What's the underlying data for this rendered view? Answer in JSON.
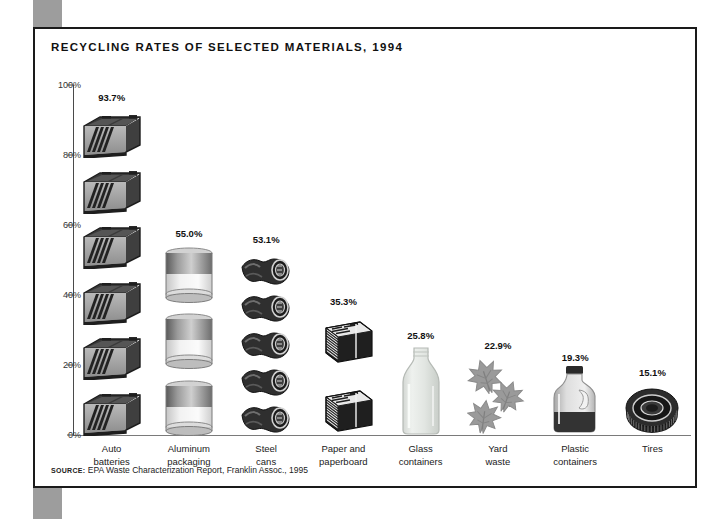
{
  "figure": {
    "title": "RECYCLING RATES OF SELECTED MATERIALS, 1994",
    "source_label": "SOURCE:",
    "source_text": " EPA Waste Characterization Report, Franklin Assoc., 1995"
  },
  "colors": {
    "frame_border": "#1a1a1a",
    "page_tab": "#9d9d9d",
    "axis": "#4a4a4a",
    "baseline": "#7a7a7a",
    "text": "#111111",
    "icon_dark": "#2b2b2b",
    "icon_mid": "#8c8c8c",
    "icon_light": "#d9d9d9"
  },
  "chart_data": {
    "type": "bar",
    "title": "RECYCLING RATES OF SELECTED MATERIALS, 1994",
    "subtitle": "",
    "xlabel": "",
    "ylabel": "",
    "ylim": [
      0,
      100
    ],
    "grid": false,
    "legend": "none",
    "units": "percent",
    "ytick_labels": [
      "0%",
      "20%",
      "40%",
      "60%",
      "80%",
      "100%"
    ],
    "ytick_values": [
      0,
      20,
      40,
      60,
      80,
      100
    ],
    "categories": [
      "Auto batteries",
      "Aluminum packaging",
      "Steel cans",
      "Paper and paperboard",
      "Glass containers",
      "Yard waste",
      "Plastic containers",
      "Tires"
    ],
    "values": [
      93.7,
      55.0,
      53.1,
      35.3,
      25.8,
      22.9,
      19.3,
      15.1
    ],
    "data_labels": [
      "93.7%",
      "55.0%",
      "53.1%",
      "35.3%",
      "25.8%",
      "22.9%",
      "19.3%",
      "15.1%"
    ]
  },
  "bars": [
    {
      "label_line1": "Auto",
      "label_line2": "batteries",
      "value_label": "93.7%",
      "value": 93.7,
      "icon": "car-battery-icon",
      "icon_count": 6
    },
    {
      "label_line1": "Aluminum",
      "label_line2": "packaging",
      "value_label": "55.0%",
      "value": 55.0,
      "icon": "aluminum-can-icon",
      "icon_count": 3
    },
    {
      "label_line1": "Steel",
      "label_line2": "cans",
      "value_label": "53.1%",
      "value": 53.1,
      "icon": "steel-can-icon",
      "icon_count": 5
    },
    {
      "label_line1": "Paper and",
      "label_line2": "paperboard",
      "value_label": "35.3%",
      "value": 35.3,
      "icon": "newspaper-icon",
      "icon_count": 2
    },
    {
      "label_line1": "Glass",
      "label_line2": "containers",
      "value_label": "25.8%",
      "value": 25.8,
      "icon": "glass-bottle-icon",
      "icon_count": 1
    },
    {
      "label_line1": "Yard",
      "label_line2": "waste",
      "value_label": "22.9%",
      "value": 22.9,
      "icon": "leaves-icon",
      "icon_count": 1
    },
    {
      "label_line1": "Plastic",
      "label_line2": "containers",
      "value_label": "19.3%",
      "value": 19.3,
      "icon": "plastic-jug-icon",
      "icon_count": 1
    },
    {
      "label_line1": "Tires",
      "label_line2": "",
      "value_label": "15.1%",
      "value": 15.1,
      "icon": "tire-icon",
      "icon_count": 1
    }
  ]
}
